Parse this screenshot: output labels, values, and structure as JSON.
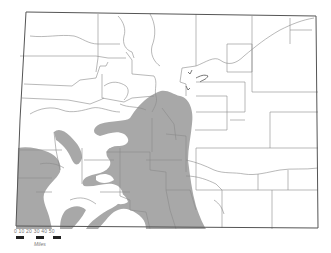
{
  "map": {
    "subject": "Colorado county map with shaded species distribution range",
    "colors": {
      "background": "#ffffff",
      "range_fill": "#a8a8a8",
      "county_lines": "#8a8a8a",
      "state_border": "#555555"
    }
  },
  "scale": {
    "ticks": [
      "0",
      "10",
      "20",
      "30",
      "40",
      "50"
    ],
    "label_text": "0  10  20  30  40  50",
    "units": "Miles"
  }
}
